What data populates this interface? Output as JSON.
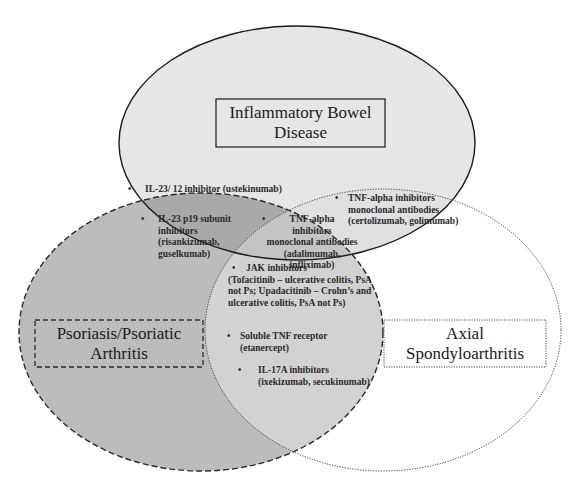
{
  "diagram": {
    "type": "venn",
    "sets": [
      {
        "id": "ibd",
        "label": "Inflammatory Bowel Disease",
        "label_lines": [
          "Inflammatory Bowel",
          "Disease"
        ],
        "border": "solid",
        "fill": "#e6e6e6"
      },
      {
        "id": "pso",
        "label": "Psoriasis/Psoriatic Arthritis",
        "label_lines": [
          "Psoriasis/Psoriatic",
          "Arthritis"
        ],
        "border": "dashed",
        "fill": "#bdbdbd"
      },
      {
        "id": "axspa",
        "label": "Axial Spondyloarthritis",
        "label_lines": [
          "Axial",
          "Spondyloarthritis"
        ],
        "border": "dotted",
        "fill": "#ffffff"
      }
    ],
    "regions": {
      "ibd_pso": [
        {
          "lines": [
            "IL-23/ 12 inhibitor (ustekinumab)"
          ]
        },
        {
          "lines": [
            "IL-23 p19 subunit",
            "inhibitors",
            "(risankizumab,",
            "guselkumab)"
          ]
        }
      ],
      "ibd_axspa": [
        {
          "lines": [
            "TNF-alpha inhibitors",
            "monoclonal antibodies",
            "(certolizumab, golimumab)"
          ]
        }
      ],
      "ibd_pso_axspa": [
        {
          "lines": [
            "TNF-alpha",
            "inhibitors",
            "monoclonal antibodies",
            "(adalimumab, infliximab)"
          ]
        },
        {
          "lines": [
            "JAK inhibitors",
            "(Tofacitinib – ulcerative colitis, PsA",
            "not Ps; Upadacitinib – Crohn’s and",
            "ulcerative colitis, PsA not Ps)"
          ]
        }
      ],
      "pso_axspa": [
        {
          "lines": [
            "Soluble TNF receptor",
            "(etanercept)"
          ]
        },
        {
          "lines": [
            "IL-17A inhibitors",
            "(ixekizumab, secukinumab)"
          ]
        }
      ]
    },
    "colors": {
      "ibd_fill": "#e6e6e6",
      "pso_fill": "#bcbcbc",
      "overlap_ibd_pso": "#a9a9a9",
      "overlap_all": "#c4c4c4",
      "overlap_pso_axspa": "#d2d2d2",
      "stroke": "#1a1a1a"
    },
    "bullet_char": "•"
  }
}
